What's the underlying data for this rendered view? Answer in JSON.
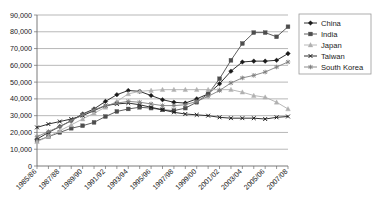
{
  "chart_data": {
    "type": "line",
    "title": "",
    "xlabel": "",
    "ylabel": "",
    "ylim": [
      0,
      90000
    ],
    "ytick_values": [
      0,
      10000,
      20000,
      30000,
      40000,
      50000,
      60000,
      70000,
      80000,
      90000
    ],
    "ytick_labels": [
      "0",
      "10,000",
      "20,000",
      "30,000",
      "40,000",
      "50,000",
      "60,000",
      "70,000",
      "80,000",
      "90,000"
    ],
    "grid": true,
    "legend_position": "right",
    "x": [
      "1985/86",
      "1986/87",
      "1987/88",
      "1988/89",
      "1989/90",
      "1990/91",
      "1991/92",
      "1992/93",
      "1993/94",
      "1994/95",
      "1995/96",
      "1996/97",
      "1997/98",
      "1998/99",
      "1999/00",
      "2000/01",
      "2001/02",
      "2002/03",
      "2003/04",
      "2004/05",
      "2005/06",
      "2006/07",
      "2007/08"
    ],
    "xtick_labels": [
      "1985/86",
      "1987/88",
      "1989/90",
      "1991/92",
      "1993/94",
      "1995/96",
      "1997/98",
      "1999/00",
      "2001/02",
      "2003/04",
      "2005/06",
      "2007/08"
    ],
    "xtick_indices": [
      0,
      2,
      4,
      6,
      8,
      10,
      12,
      14,
      16,
      18,
      20,
      22
    ],
    "series": [
      {
        "name": "China",
        "marker": "diamond",
        "color": "#1a1a1a",
        "values": [
          16000,
          20000,
          23500,
          27000,
          31000,
          34000,
          38500,
          42500,
          45000,
          44500,
          42000,
          39500,
          38000,
          37500,
          40000,
          43000,
          49000,
          56500,
          62000,
          62500,
          62500,
          63000,
          67000
        ]
      },
      {
        "name": "India",
        "marker": "square",
        "color": "#4d4d4d",
        "values": [
          15000,
          17500,
          20000,
          22500,
          24000,
          26000,
          29500,
          32500,
          34000,
          35000,
          34500,
          33500,
          33000,
          34500,
          38000,
          43000,
          52000,
          63000,
          73000,
          79500,
          79500,
          77000,
          83000
        ]
      },
      {
        "name": "Japan",
        "marker": "triangle",
        "color": "#b0b0b0",
        "values": [
          14500,
          17500,
          21000,
          24500,
          28000,
          31500,
          35000,
          38500,
          43000,
          44500,
          45000,
          45500,
          45500,
          45500,
          45500,
          45500,
          45500,
          45500,
          44000,
          42000,
          41000,
          38000,
          34000
        ]
      },
      {
        "name": "Taiwan",
        "marker": "x",
        "color": "#1a1a1a",
        "values": [
          23000,
          25000,
          26500,
          28000,
          30000,
          33000,
          36000,
          37000,
          37500,
          36500,
          35000,
          33500,
          32000,
          31000,
          30500,
          30000,
          29000,
          28500,
          28500,
          28500,
          28000,
          29000,
          29500
        ]
      },
      {
        "name": "South Korea",
        "marker": "asterisk",
        "color": "#808080",
        "values": [
          17500,
          20500,
          23500,
          27000,
          30500,
          33500,
          36000,
          37500,
          38500,
          38000,
          37000,
          36000,
          36000,
          36500,
          38500,
          41500,
          45000,
          49500,
          52500,
          54000,
          56000,
          59000,
          62000
        ]
      }
    ]
  },
  "legend": {
    "items": [
      {
        "label": "China"
      },
      {
        "label": "India"
      },
      {
        "label": "Japan"
      },
      {
        "label": "Taiwan"
      },
      {
        "label": "South Korea"
      }
    ]
  }
}
